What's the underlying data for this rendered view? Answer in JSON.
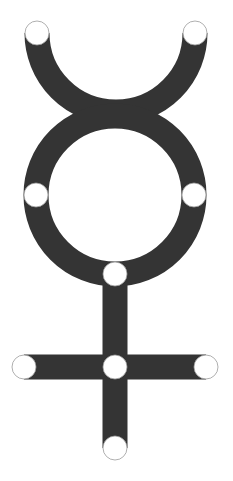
{
  "symbol": {
    "name": "mercury-symbol",
    "colors": {
      "shape": "#343434",
      "background": "#ffffff",
      "node_fill": "#ffffff",
      "node_stroke": "#9a9a9a"
    },
    "stroke_width": 25,
    "horns": {
      "cx": 116,
      "cy": 33,
      "r": 79
    },
    "ring": {
      "cx": 115,
      "cy": 195,
      "r": 79
    },
    "stem": {
      "x": 115,
      "y1": 274,
      "y2": 448
    },
    "crossbar": {
      "y": 367,
      "x1": 24,
      "x2": 206
    },
    "node_radius": 12,
    "nodes": [
      {
        "id": "horn-left-tip",
        "cx": 37,
        "cy": 33
      },
      {
        "id": "horn-right-tip",
        "cx": 195,
        "cy": 33
      },
      {
        "id": "ring-left",
        "cx": 36,
        "cy": 195
      },
      {
        "id": "ring-right",
        "cx": 194,
        "cy": 195
      },
      {
        "id": "ring-bottom",
        "cx": 115,
        "cy": 274
      },
      {
        "id": "crossbar-left",
        "cx": 24,
        "cy": 367
      },
      {
        "id": "crossbar-center",
        "cx": 115,
        "cy": 367
      },
      {
        "id": "crossbar-right",
        "cx": 206,
        "cy": 367
      },
      {
        "id": "stem-bottom",
        "cx": 115,
        "cy": 448
      }
    ]
  }
}
